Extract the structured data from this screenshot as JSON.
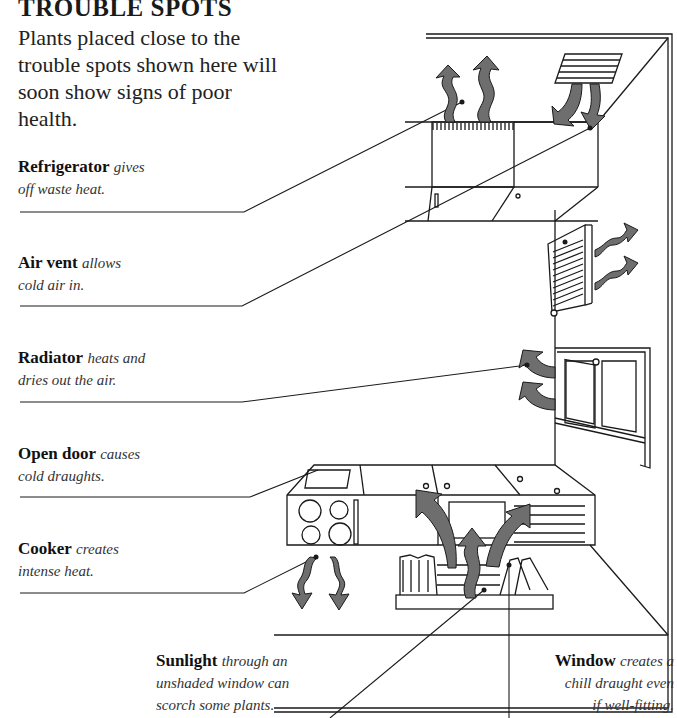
{
  "header": {
    "title": "TROUBLE SPOTS",
    "intro": "Plants placed close to the trouble spots shown here will soon show signs of poor health."
  },
  "callouts": [
    {
      "id": "refrigerator",
      "term": "Refrigerator",
      "description_line1": "gives",
      "description_line2": "off waste heat."
    },
    {
      "id": "air-vent",
      "term": "Air vent",
      "description_line1": "allows",
      "description_line2": "cold air in."
    },
    {
      "id": "radiator",
      "term": "Radiator",
      "description_line1": "heats and",
      "description_line2": "dries out the air."
    },
    {
      "id": "open-door",
      "term": "Open door",
      "description_line1": "causes",
      "description_line2": "cold draughts."
    },
    {
      "id": "cooker",
      "term": "Cooker",
      "description_line1": "creates",
      "description_line2": "intense heat."
    },
    {
      "id": "sunlight",
      "term": "Sunlight",
      "description_line1": "through an",
      "description_line2": "unshaded window can",
      "description_line3": "scorch some plants."
    },
    {
      "id": "window",
      "term": "Window",
      "description_line1": "creates a",
      "description_line2": "chill draught even",
      "description_line3": "if well-fitting."
    }
  ],
  "colors": {
    "ink": "#1a1a1a",
    "arrow_fill": "#6e6e6e",
    "background": "#ffffff"
  }
}
